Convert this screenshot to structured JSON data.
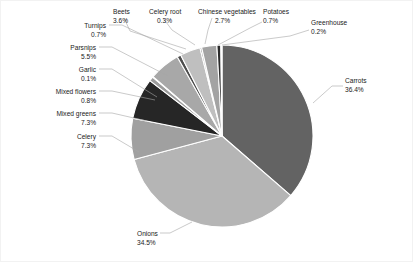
{
  "chart_data": {
    "type": "pie",
    "title": "",
    "subtitle": "",
    "xlabel": "",
    "ylabel": "",
    "legend_position": "none",
    "grid": false,
    "value_unit": "percent",
    "total": 100.0,
    "categories": [
      "Carrots",
      "Onions",
      "Celery",
      "Mixed greens",
      "Mixed flowers",
      "Garlic",
      "Parsnips",
      "Turnips",
      "Beets",
      "Celery root",
      "Chinese vegetables",
      "Potatoes",
      "Greenhouse"
    ],
    "values": [
      36.4,
      34.5,
      7.3,
      7.3,
      0.8,
      0.1,
      5.5,
      0.7,
      3.6,
      0.3,
      2.7,
      0.7,
      0.2
    ],
    "slices": [
      {
        "label": "Carrots",
        "value": 36.4,
        "display": "36.4%",
        "color": "#636363",
        "label_x": 345,
        "label_y": 83,
        "val_x": 345,
        "val_y": 92,
        "anchor": "start",
        "leader": "M 313,103 L 332,86 L 343,86"
      },
      {
        "label": "Onions",
        "value": 34.5,
        "display": "34.5%",
        "color": "#b5b5b5",
        "label_x": 137,
        "label_y": 236,
        "val_x": 137,
        "val_y": 245,
        "anchor": "start",
        "leader": "M 192,222 L 170,233 L 160,233"
      },
      {
        "label": "Celery",
        "value": 7.3,
        "display": "7.3%",
        "color": "#a0a0a0",
        "label_x": 96,
        "label_y": 139,
        "val_x": 96,
        "val_y": 148,
        "anchor": "end",
        "leader": "M 139,152 L 112,136 L 99,136"
      },
      {
        "label": "Mixed greens",
        "value": 7.3,
        "display": "7.3%",
        "color": "#262626",
        "label_x": 96,
        "label_y": 116,
        "val_x": 96,
        "val_y": 125,
        "anchor": "end",
        "leader": "M 147,121 L 112,113 L 99,113"
      },
      {
        "label": "Mixed flowers",
        "value": 0.8,
        "display": "0.8%",
        "color": "#9c9c9c",
        "label_x": 96,
        "label_y": 94,
        "val_x": 96,
        "val_y": 103,
        "anchor": "end",
        "leader": "M 155,100 L 112,91 L 99,91"
      },
      {
        "label": "Garlic",
        "value": 0.1,
        "display": "0.1%",
        "color": "#d9d9d9",
        "label_x": 96,
        "label_y": 72,
        "val_x": 96,
        "val_y": 81,
        "anchor": "end",
        "leader": "M 157,97 L 112,69 L 99,69"
      },
      {
        "label": "Parsnips",
        "value": 5.5,
        "display": "5.5%",
        "color": "#a8a8a8",
        "label_x": 96,
        "label_y": 50,
        "val_x": 96,
        "val_y": 59,
        "anchor": "end",
        "leader": "M 168,76 L 112,47 L 99,47"
      },
      {
        "label": "Turnips",
        "value": 0.7,
        "display": "0.7%",
        "color": "#4d4d4d",
        "label_x": 106,
        "label_y": 28,
        "val_x": 106,
        "val_y": 37,
        "anchor": "end",
        "leader": "M 183,54 L 122,25 L 109,25"
      },
      {
        "label": "Beets",
        "value": 3.6,
        "display": "3.6%",
        "color": "#bfbfbf",
        "label_x": 113,
        "label_y": 14,
        "val_x": 113,
        "val_y": 23,
        "anchor": "start",
        "leader": "M 186,49 L 130,31 L 124,18"
      },
      {
        "label": "Celery root",
        "value": 0.3,
        "display": "0.3%",
        "color": "#8c8c8c",
        "label_x": 149,
        "label_y": 14,
        "val_x": 157,
        "val_y": 23,
        "anchor": "start",
        "leader": "M 195,45 L 172,30 L 163,18"
      },
      {
        "label": "Chinese vegetables",
        "value": 2.7,
        "display": "2.7%",
        "color": "#a3a3a3",
        "label_x": 198,
        "label_y": 14,
        "val_x": 215,
        "val_y": 23,
        "anchor": "start",
        "leader": "M 205,44 L 208,30 L 212,18"
      },
      {
        "label": "Potatoes",
        "value": 0.7,
        "display": "0.7%",
        "color": "#2b2b2b",
        "label_x": 263,
        "label_y": 14,
        "val_x": 263,
        "val_y": 23,
        "anchor": "start",
        "leader": "M 218,45 L 250,28 L 262,22"
      },
      {
        "label": "Greenhouse",
        "value": 0.2,
        "display": "0.2%",
        "color": "#cfcfcf",
        "label_x": 311,
        "label_y": 25,
        "val_x": 311,
        "val_y": 34,
        "anchor": "start",
        "leader": "M 222,45 L 290,36 L 309,30"
      }
    ],
    "geometry": {
      "center_x": 222,
      "center_y": 136,
      "radius": 91,
      "start_angle_deg": -90,
      "direction": "clockwise"
    },
    "colors": {
      "background": "#ffffff",
      "separator": "#ffffff",
      "leader_line": "#a6a6a6",
      "text": "#1a1a1a",
      "frame": "#f2f2f2"
    }
  }
}
